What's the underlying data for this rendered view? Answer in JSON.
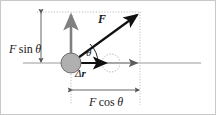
{
  "figure": {
    "background_color": "#ffffff",
    "border_color": "#c8c8c8",
    "labels": {
      "vertical_component": {
        "symbol": "F",
        "operator": "sin",
        "angle": "θ",
        "text": "F sin θ"
      },
      "horizontal_component": {
        "symbol": "F",
        "operator": "cos",
        "angle": "θ",
        "text": "F cos θ"
      },
      "force_vector": "F",
      "angle": "θ",
      "displacement": {
        "delta": "Δ",
        "symbol": "r",
        "text": "Δr"
      }
    },
    "colors": {
      "axis": "#9a9a9a",
      "vector": "#111111",
      "component_arrow": "#808080",
      "particle_fill": "#b0b0b0",
      "particle_stroke": "#6e6e6e",
      "guide_dotted": "#b8b8b8",
      "dimension": "#555555"
    },
    "geometry": {
      "origin": {
        "x": 70,
        "y": 62
      },
      "force_tip": {
        "x": 139,
        "y": 11
      },
      "vertical_tip": {
        "x": 70,
        "y": 11
      },
      "horizontal_tip": {
        "x": 139,
        "y": 62
      },
      "displacement_tip": {
        "x": 108,
        "y": 62
      },
      "particle_radius": 10,
      "ghost_circle": {
        "x": 110,
        "y": 62,
        "r": 9
      },
      "axis_from_x": 22,
      "axis_to_x": 200,
      "vertical_dim_x": 40,
      "horizontal_dim_y": 89
    }
  }
}
